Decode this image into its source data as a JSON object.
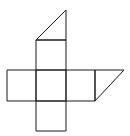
{
  "diagram": {
    "title": "",
    "stroke_color": "#1a1a1a",
    "background": "#ffffff",
    "shapes": [
      {
        "name": "top-square",
        "points": "36,40 66,40 66,70 36,70"
      },
      {
        "name": "left-square",
        "points": "7,70 36,70 36,101 7,101"
      },
      {
        "name": "center-square",
        "points": "36,70 66,70 66,101 36,101"
      },
      {
        "name": "right-square",
        "points": "66,70 95,70 95,101 66,101"
      },
      {
        "name": "bottom-square",
        "points": "36,101 66,101 66,131 36,131"
      },
      {
        "name": "top-triangle",
        "points": "36,40 66,10 66,40"
      },
      {
        "name": "right-parallelogram",
        "points": "95,70 124,70 95,101"
      }
    ]
  }
}
